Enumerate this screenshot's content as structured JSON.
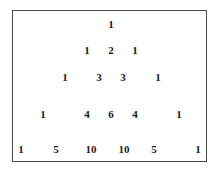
{
  "figure": {
    "name": "pascals-triangle",
    "border_color": "#4a4a4a",
    "background_color": "#ffffff",
    "text_color": "#1a1a1a"
  },
  "chart_data": {
    "type": "table",
    "title": "",
    "subtitle": "",
    "xlabel": "",
    "ylabel": "",
    "grid": false,
    "legend": false,
    "rows": [
      {
        "index": 0,
        "values": [
          1
        ],
        "x_positions": [
          110
        ],
        "y": 16
      },
      {
        "index": 1,
        "values": [
          1,
          2,
          1
        ],
        "x_positions": [
          86,
          110,
          134
        ],
        "y": 42
      },
      {
        "index": 2,
        "values": [
          1,
          3,
          3,
          1
        ],
        "x_positions": [
          64,
          98,
          122,
          157
        ],
        "y": 69
      },
      {
        "index": 3,
        "values": [
          1,
          4,
          6,
          4,
          1
        ],
        "x_positions": [
          42,
          86,
          110,
          134,
          178
        ],
        "y": 106
      },
      {
        "index": 4,
        "values": [
          1,
          5,
          10,
          10,
          5,
          1
        ],
        "x_positions": [
          20,
          55,
          90,
          123,
          153,
          197
        ],
        "y": 141
      }
    ]
  }
}
